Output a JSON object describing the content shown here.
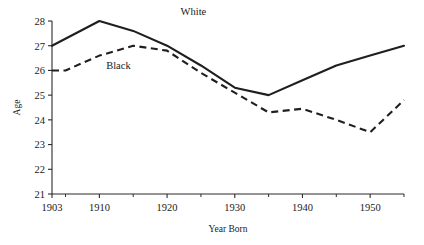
{
  "chart_data": {
    "type": "line",
    "title": "",
    "xlabel": "Year Born",
    "ylabel": "Age",
    "xlim": [
      1903,
      1955
    ],
    "ylim": [
      21,
      28
    ],
    "grid": false,
    "legend_position": "inline-annotation",
    "xticks": [
      1903,
      1910,
      1920,
      1930,
      1940,
      1950
    ],
    "xtick_labels": [
      "1903",
      "1910",
      "1920",
      "1930",
      "1940",
      "1950"
    ],
    "xticks_minor": [
      1905,
      1915,
      1925,
      1935,
      1945,
      1955
    ],
    "yticks": [
      21,
      22,
      23,
      24,
      25,
      26,
      27,
      28
    ],
    "ytick_labels": [
      "21",
      "22",
      "23",
      "24",
      "25",
      "26",
      "27",
      "28"
    ],
    "series": [
      {
        "name": "White",
        "style": "solid",
        "label_x": 1922,
        "label_y": 28.25,
        "x": [
          1903,
          1910,
          1915,
          1920,
          1925,
          1930,
          1935,
          1940,
          1945,
          1950,
          1955
        ],
        "values": [
          27.0,
          28.0,
          27.6,
          27.0,
          26.2,
          25.3,
          25.0,
          25.6,
          26.2,
          26.6,
          27.0
        ]
      },
      {
        "name": "Black",
        "style": "dashed",
        "label_x": 1911,
        "label_y": 26.05,
        "x": [
          1903,
          1905,
          1910,
          1915,
          1920,
          1925,
          1930,
          1935,
          1940,
          1945,
          1950,
          1955
        ],
        "values": [
          26.0,
          26.0,
          26.6,
          27.0,
          26.8,
          25.9,
          25.1,
          24.3,
          24.45,
          24.0,
          23.5,
          24.8
        ]
      }
    ]
  },
  "axes": {
    "y_axis_title": "Age",
    "x_axis_title": "Year Born"
  }
}
